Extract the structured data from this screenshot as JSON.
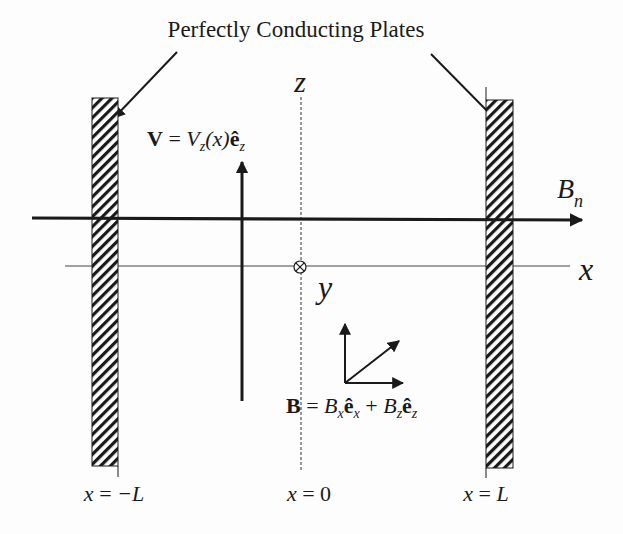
{
  "diagram": {
    "title": "Perfectly Conducting Plates",
    "axes": {
      "z_label": "z",
      "x_label": "x",
      "y_label": "y",
      "y_axis_symbol": "into-page (⊗)"
    },
    "field_line_label": {
      "main": "B",
      "sub": "n"
    },
    "velocity_eq": {
      "lhs": "V",
      "eq": " = ",
      "V": "V",
      "V_sub": "z",
      "arg": "(x)",
      "e": "ê",
      "e_sub": "z"
    },
    "magnetic_eq": {
      "lhs": "B",
      "eq": " = ",
      "B1": "B",
      "B1_sub": "x",
      "e1": "ê",
      "e1_sub": "x",
      "plus": " + ",
      "B2": "B",
      "B2_sub": "z",
      "e2": "ê",
      "e2_sub": "z"
    },
    "positions": {
      "left": {
        "lhs": "x",
        "eq": " = ",
        "rhs": "−L"
      },
      "center": {
        "lhs": "x",
        "eq": " = ",
        "rhs": "0"
      },
      "right": {
        "lhs": "x",
        "eq": " = ",
        "rhs": "L"
      }
    },
    "colors": {
      "ink": "#1a1a1a",
      "background": "#fdfdfd"
    }
  }
}
